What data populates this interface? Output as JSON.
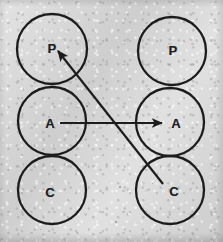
{
  "diagram": {
    "canvas": {
      "width": 223,
      "height": 242
    },
    "background_color": "#d9d9d9",
    "ink_color": "#1d1d1d",
    "stroke_width": 2.2,
    "circles": [
      {
        "id": "left-p",
        "label": "P",
        "cx": 52,
        "cy": 49,
        "r": 35,
        "label_x": 52,
        "label_y": 48
      },
      {
        "id": "left-a",
        "label": "A",
        "cx": 52,
        "cy": 121,
        "r": 34,
        "label_x": 50,
        "label_y": 123
      },
      {
        "id": "left-c",
        "label": "C",
        "cx": 52,
        "cy": 190,
        "r": 34,
        "label_x": 50,
        "label_y": 192
      },
      {
        "id": "right-p",
        "label": "P",
        "cx": 172,
        "cy": 51,
        "r": 34,
        "label_x": 173,
        "label_y": 50
      },
      {
        "id": "right-a",
        "label": "A",
        "cx": 170,
        "cy": 122,
        "r": 34,
        "label_x": 176,
        "label_y": 123
      },
      {
        "id": "right-c",
        "label": "C",
        "cx": 170,
        "cy": 190,
        "r": 34,
        "label_x": 174,
        "label_y": 191
      }
    ],
    "arrows": [
      {
        "id": "arrow-a-to-a",
        "from": "left-a",
        "to": "right-a",
        "x1": 60,
        "y1": 123,
        "x2": 162,
        "y2": 123
      },
      {
        "id": "arrow-c-to-p",
        "from": "right-c",
        "to": "left-p",
        "x1": 163,
        "y1": 184,
        "x2": 58,
        "y2": 51
      }
    ],
    "specks": [
      {
        "x": 86,
        "y": 105,
        "size": 1.6
      },
      {
        "x": 119,
        "y": 186,
        "size": 1.6
      },
      {
        "x": 152,
        "y": 183,
        "size": 1.4
      },
      {
        "x": 115,
        "y": 221,
        "size": 1.5
      },
      {
        "x": 40,
        "y": 229,
        "size": 1.3
      },
      {
        "x": 197,
        "y": 146,
        "size": 1.2
      }
    ]
  }
}
